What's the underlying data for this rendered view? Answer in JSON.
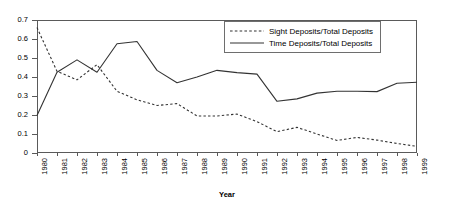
{
  "chart_data": {
    "type": "line",
    "title": "",
    "xlabel": "Year",
    "ylabel": "",
    "grid": false,
    "legend_position": "top-right",
    "x": [
      1980,
      1981,
      1982,
      1983,
      1984,
      1985,
      1986,
      1987,
      1988,
      1989,
      1990,
      1991,
      1992,
      1993,
      1994,
      1995,
      1996,
      1997,
      1998,
      1999
    ],
    "categories": [
      "1980",
      "1981",
      "1982",
      "1983",
      "1984",
      "1985",
      "1986",
      "1987",
      "1988",
      "1989",
      "1990",
      "1991",
      "1992",
      "1993",
      "1994",
      "1995",
      "1996",
      "1997",
      "1998",
      "1999"
    ],
    "xlim": [
      1980,
      1999
    ],
    "ylim": [
      0,
      0.7
    ],
    "yticks": [
      "0",
      "0.1",
      "0.2",
      "0.3",
      "0.4",
      "0.5",
      "0.6",
      "0.7"
    ],
    "ytick_values": [
      0,
      0.1,
      0.2,
      0.3,
      0.4,
      0.5,
      0.6,
      0.7
    ],
    "series": [
      {
        "name": "Sight Deposits/Total Deposits",
        "style": "dashed",
        "color": "#333333",
        "values": [
          0.66,
          0.43,
          0.385,
          0.465,
          0.325,
          0.28,
          0.25,
          0.26,
          0.195,
          0.195,
          0.205,
          0.165,
          0.112,
          0.135,
          0.1,
          0.066,
          0.082,
          0.068,
          0.05,
          0.035
        ]
      },
      {
        "name": "Time Deposits/Total Deposits",
        "style": "solid",
        "color": "#333333",
        "values": [
          0.197,
          0.425,
          0.49,
          0.425,
          0.575,
          0.587,
          0.435,
          0.37,
          0.4,
          0.435,
          0.423,
          0.415,
          0.272,
          0.285,
          0.315,
          0.325,
          0.325,
          0.323,
          0.367,
          0.372
        ]
      }
    ]
  },
  "axis": {
    "x_title": "Year"
  }
}
